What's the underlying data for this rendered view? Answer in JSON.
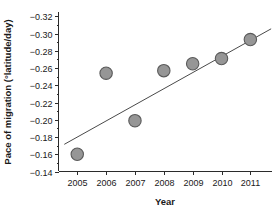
{
  "chart_data": {
    "type": "scatter",
    "title": "",
    "xlabel": "Year",
    "ylabel": "Pace of migration (°latitude/day)",
    "x": [
      2005,
      2006,
      2007,
      2008,
      2009,
      2010,
      2011
    ],
    "values": [
      -0.16,
      -0.254,
      -0.199,
      -0.257,
      -0.265,
      -0.271,
      -0.293
    ],
    "categories": [
      "2005",
      "2006",
      "2007",
      "2008",
      "2009",
      "2010",
      "2011"
    ],
    "xtick_labels": [
      "2005",
      "2006",
      "2007",
      "2008",
      "2009",
      "2010",
      "2011"
    ],
    "ytick_labels": [
      "−0.32",
      "−0.30",
      "−0.28",
      "−0.26",
      "−0.24",
      "−0.22",
      "−0.20",
      "−0.18",
      "−0.16",
      "−0.14"
    ],
    "ytick_values": [
      -0.32,
      -0.3,
      -0.28,
      -0.26,
      -0.24,
      -0.22,
      -0.2,
      -0.18,
      -0.16,
      -0.14
    ],
    "xlim": [
      2004.35,
      2011.75
    ],
    "ylim": [
      -0.14,
      -0.325
    ],
    "y_axis_inverted": true,
    "grid": false,
    "legend": false,
    "series": [
      {
        "name": "Pace of migration",
        "marker": "circle",
        "marker_fill": "#969696",
        "marker_edge": "#5a5a5a",
        "values": [
          -0.16,
          -0.254,
          -0.199,
          -0.257,
          -0.265,
          -0.271,
          -0.293
        ]
      }
    ],
    "trendline": {
      "type": "linear",
      "x_start": 2004.55,
      "y_start": -0.1715,
      "x_end": 2011.72,
      "y_end": -0.3055,
      "color": "#4a4a4a"
    }
  },
  "axes": {
    "x_title": "Year",
    "y_title": "Pace of migration (°latitude/day)"
  },
  "colors": {
    "marker_fill": "#969696",
    "marker_edge": "#5a5a5a",
    "axis": "#2b2b2b",
    "trendline": "#4a4a4a",
    "background": "#ffffff"
  }
}
